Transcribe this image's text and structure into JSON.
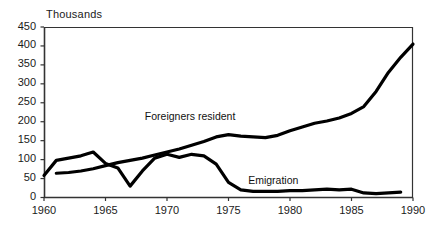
{
  "chart_data": {
    "type": "line",
    "title": "",
    "unit_label": "Thousands",
    "xlabel": "",
    "ylabel": "",
    "xlim": [
      1960,
      1990
    ],
    "ylim": [
      0,
      450
    ],
    "yticks": [
      0,
      50,
      100,
      150,
      200,
      250,
      300,
      350,
      400,
      450
    ],
    "xticks": [
      1960,
      1965,
      1970,
      1975,
      1980,
      1985,
      1990
    ],
    "grid": false,
    "legend_position": "inline-annotations",
    "line_color": "#000000",
    "axis_color": "#333333",
    "background": "#ffffff",
    "series": [
      {
        "name": "Foreigners  resident",
        "label_x": 1968.2,
        "label_y": 212,
        "x": [
          1961,
          1962,
          1963,
          1964,
          1965,
          1966,
          1967,
          1968,
          1969,
          1970,
          1971,
          1972,
          1973,
          1974,
          1975,
          1976,
          1977,
          1978,
          1979,
          1980,
          1981,
          1982,
          1983,
          1984,
          1985,
          1986,
          1987,
          1988,
          1989,
          1990
        ],
        "values": [
          64,
          66,
          70,
          76,
          84,
          92,
          98,
          104,
          112,
          120,
          128,
          138,
          148,
          160,
          166,
          162,
          160,
          158,
          164,
          176,
          186,
          196,
          202,
          210,
          222,
          240,
          280,
          330,
          370,
          405
        ]
      },
      {
        "name": "Emigration",
        "label_x": 1976.6,
        "label_y": 44,
        "x": [
          1960,
          1961,
          1962,
          1963,
          1964,
          1965,
          1966,
          1967,
          1968,
          1969,
          1970,
          1971,
          1972,
          1973,
          1974,
          1975,
          1976,
          1977,
          1978,
          1979,
          1980,
          1981,
          1982,
          1983,
          1984,
          1985,
          1986,
          1987,
          1988,
          1989
        ],
        "values": [
          58,
          98,
          104,
          110,
          120,
          90,
          78,
          30,
          70,
          104,
          114,
          106,
          114,
          110,
          88,
          40,
          20,
          16,
          16,
          16,
          18,
          18,
          20,
          22,
          20,
          22,
          12,
          10,
          12,
          14
        ]
      }
    ]
  }
}
